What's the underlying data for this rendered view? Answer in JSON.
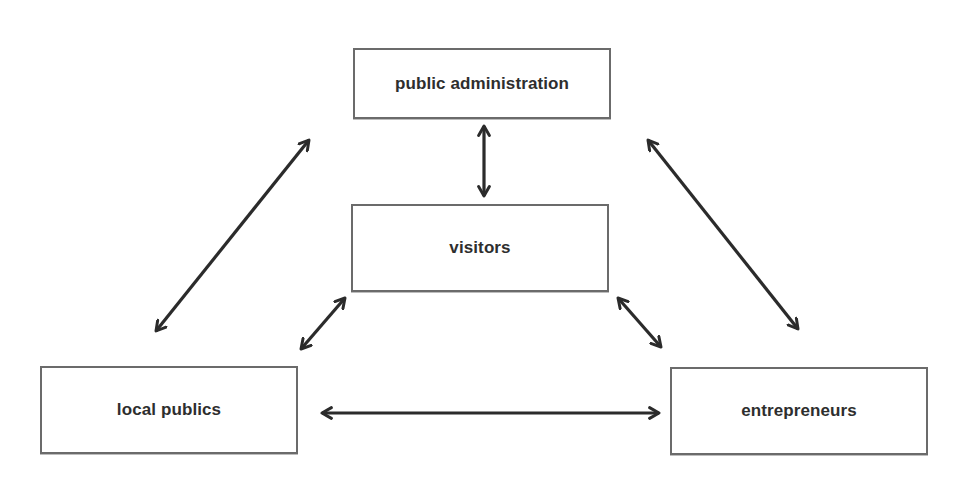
{
  "diagram": {
    "type": "stakeholder relationship diagram",
    "colors": {
      "background": "#ffffff",
      "box_border": "#6b6b6b",
      "text": "#2e2e2e",
      "arrow": "#2b2b2b"
    },
    "nodes": {
      "public_administration": {
        "label": "public administration",
        "x": 353,
        "y": 48,
        "w": 258,
        "h": 71
      },
      "visitors": {
        "label": "visitors",
        "x": 351,
        "y": 204,
        "w": 258,
        "h": 88
      },
      "local_publics": {
        "label": "local publics",
        "x": 40,
        "y": 366,
        "w": 258,
        "h": 88
      },
      "entrepreneurs": {
        "label": "entrepreneurs",
        "x": 670,
        "y": 367,
        "w": 258,
        "h": 88
      }
    },
    "edges": [
      {
        "from": "public administration",
        "to": "visitors",
        "direction": "bidirectional"
      },
      {
        "from": "public administration",
        "to": "local publics",
        "direction": "bidirectional"
      },
      {
        "from": "public administration",
        "to": "entrepreneurs",
        "direction": "bidirectional"
      },
      {
        "from": "visitors",
        "to": "local publics",
        "direction": "bidirectional"
      },
      {
        "from": "visitors",
        "to": "entrepreneurs",
        "direction": "bidirectional"
      },
      {
        "from": "local publics",
        "to": "entrepreneurs",
        "direction": "bidirectional"
      }
    ]
  }
}
